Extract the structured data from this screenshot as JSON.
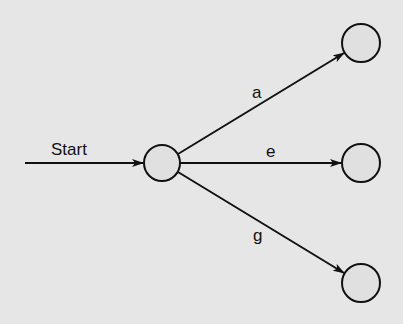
{
  "diagram": {
    "type": "state-transition",
    "background": "#e6e6e6",
    "stroke_color": "#111111",
    "node_fill": "#e0e0e0",
    "start_label": "Start",
    "nodes": [
      {
        "id": "center",
        "cx": 162,
        "cy": 163,
        "r": 18
      },
      {
        "id": "top",
        "cx": 361,
        "cy": 43,
        "r": 19
      },
      {
        "id": "middle",
        "cx": 361,
        "cy": 163,
        "r": 19
      },
      {
        "id": "bottom",
        "cx": 361,
        "cy": 283,
        "r": 19
      }
    ],
    "edges": [
      {
        "from": "start",
        "to": "center",
        "label": "Start"
      },
      {
        "from": "center",
        "to": "top",
        "label": "a"
      },
      {
        "from": "center",
        "to": "middle",
        "label": "e"
      },
      {
        "from": "center",
        "to": "bottom",
        "label": "g"
      }
    ]
  }
}
